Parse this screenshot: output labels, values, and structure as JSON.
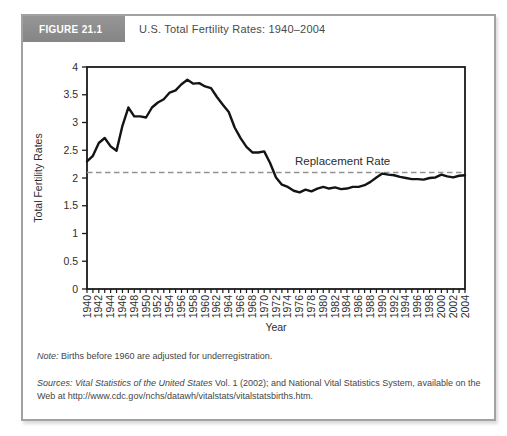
{
  "figure": {
    "tag": "FIGURE 21.1",
    "title": "U.S. Total Fertility Rates: 1940–2004"
  },
  "note": {
    "label": "Note:",
    "text": " Births before 1960 are adjusted for underregistration."
  },
  "sources": {
    "label": "Sources:",
    "work": " Vital Statistics of the United States",
    "rest": " Vol. 1 (2002); and National Vital Statistics System, available on the Web at http://www.cdc.gov/nchs/datawh/vitalstats/vitalstatsbirths.htm."
  },
  "colors": {
    "card_border": "#a2a2a2",
    "tag_background": "#8c8c8c",
    "axis": "#1a1a1a",
    "line": "#141414",
    "dashed_line": "#929292",
    "text": "#2d2d2d"
  },
  "chart_data": {
    "type": "line",
    "title": "U.S. Total Fertility Rates: 1940–2004",
    "xlabel": "Year",
    "ylabel": "Total Fertility Rates",
    "ylim": [
      0,
      4
    ],
    "ytick_step": 0.5,
    "xtick_label_every": 2,
    "grid": false,
    "legend": false,
    "annotation": {
      "label": "Replacement Rate",
      "value": 2.1,
      "style": "dashed"
    },
    "x": [
      1940,
      1941,
      1942,
      1943,
      1944,
      1945,
      1946,
      1947,
      1948,
      1949,
      1950,
      1951,
      1952,
      1953,
      1954,
      1955,
      1956,
      1957,
      1958,
      1959,
      1960,
      1961,
      1962,
      1963,
      1964,
      1965,
      1966,
      1967,
      1968,
      1969,
      1970,
      1971,
      1972,
      1973,
      1974,
      1975,
      1976,
      1977,
      1978,
      1979,
      1980,
      1981,
      1982,
      1983,
      1984,
      1985,
      1986,
      1987,
      1988,
      1989,
      1990,
      1991,
      1992,
      1993,
      1994,
      1995,
      1996,
      1997,
      1998,
      1999,
      2000,
      2001,
      2002,
      2003,
      2004
    ],
    "series": [
      {
        "name": "U.S. total fertility rate",
        "values": [
          2.3,
          2.4,
          2.63,
          2.72,
          2.57,
          2.49,
          2.94,
          3.27,
          3.11,
          3.11,
          3.09,
          3.27,
          3.36,
          3.42,
          3.54,
          3.58,
          3.69,
          3.77,
          3.7,
          3.71,
          3.65,
          3.62,
          3.46,
          3.32,
          3.19,
          2.91,
          2.72,
          2.56,
          2.46,
          2.46,
          2.48,
          2.27,
          2.01,
          1.88,
          1.84,
          1.77,
          1.74,
          1.79,
          1.76,
          1.81,
          1.84,
          1.81,
          1.83,
          1.8,
          1.81,
          1.84,
          1.84,
          1.87,
          1.93,
          2.01,
          2.08,
          2.06,
          2.05,
          2.02,
          2.0,
          1.98,
          1.98,
          1.97,
          2.0,
          2.01,
          2.06,
          2.03,
          2.01,
          2.04,
          2.05
        ]
      }
    ]
  }
}
